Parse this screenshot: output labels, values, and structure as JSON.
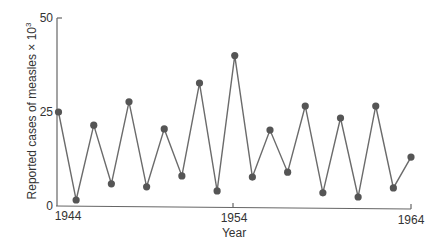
{
  "chart_data": {
    "type": "line",
    "title": "",
    "xlabel": "Year",
    "ylabel": "Reported cases of measles × 10",
    "ylabel_superscript": "3",
    "x": [
      1944,
      1945,
      1946,
      1947,
      1948,
      1949,
      1950,
      1951,
      1952,
      1953,
      1954,
      1955,
      1956,
      1957,
      1958,
      1959,
      1960,
      1961,
      1962,
      1963,
      1964
    ],
    "series": [
      {
        "name": "Reported measles cases (thousands)",
        "values": [
          25.0,
          1.6,
          21.5,
          5.9,
          27.7,
          5.1,
          20.5,
          8.0,
          32.7,
          4.0,
          40.0,
          7.7,
          20.2,
          9.0,
          26.6,
          3.5,
          23.4,
          2.4,
          26.6,
          4.8,
          13.0
        ]
      }
    ],
    "xticks": [
      "1944",
      "1954",
      "1964"
    ],
    "yticks": [
      "0",
      "25",
      "50"
    ],
    "xlim": [
      1944,
      1964
    ],
    "ylim": [
      0,
      50
    ],
    "grid": false,
    "legend": null,
    "colors": {
      "line": "#6b6b6b",
      "marker": "#555555",
      "axis": "#666666"
    }
  }
}
